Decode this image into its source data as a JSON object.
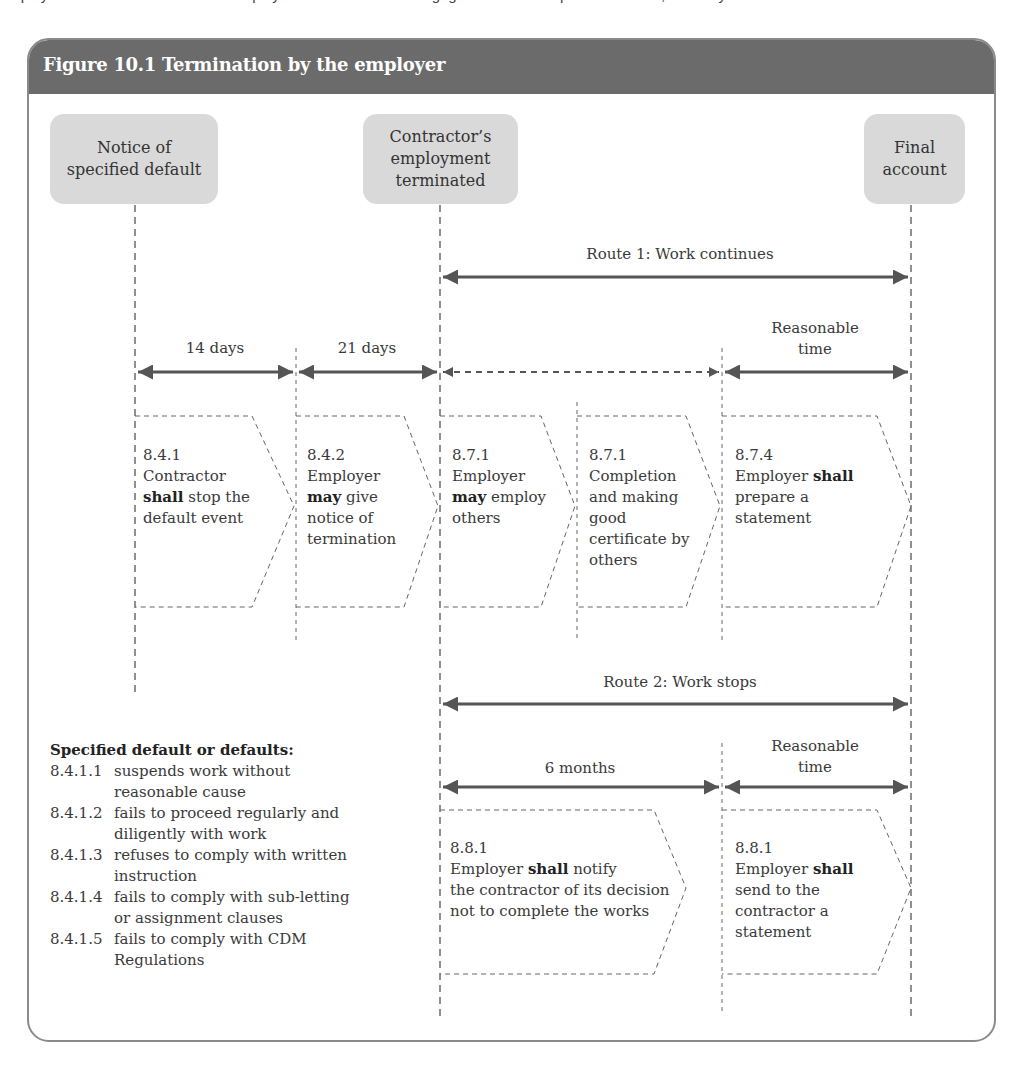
{
  "page_text_cutoff": "employment of the contractor. The employer is then entitled to engage others to complete the works, and only",
  "figure": {
    "title": "Figure 10.1  Termination by the employer",
    "colors": {
      "header": "#6b6b6b",
      "node": "#d9d9d9",
      "arrow": "#555555",
      "dash": "#555555"
    }
  },
  "nodes": [
    {
      "id": "notice",
      "label": "Notice of\nspecified default"
    },
    {
      "id": "terminated",
      "label": "Contractor’s\nemployment\nterminated"
    },
    {
      "id": "final",
      "label": "Final\naccount"
    }
  ],
  "routes": {
    "route1": {
      "label": "Route 1: Work continues"
    },
    "route2": {
      "label": "Route 2: Work stops"
    }
  },
  "periods": {
    "p14": "14 days",
    "p21": "21 days",
    "reasonable1": "Reasonable\ntime",
    "six_months": "6 months",
    "reasonable2": "Reasonable\ntime"
  },
  "steps": [
    {
      "clause": "8.4.1",
      "pre": "Contractor",
      "bold": "shall",
      "post": " stop the default event",
      "lines": [
        "Contractor",
        "shall stop the",
        "default event"
      ]
    },
    {
      "clause": "8.4.2",
      "pre": "Employer",
      "bold": "may",
      "post": " give notice of termination"
    },
    {
      "clause": "8.7.1",
      "pre": "Employer",
      "bold": "may",
      "post": " employ others"
    },
    {
      "clause": "8.7.1",
      "text": "Completion and making good certificate by others"
    },
    {
      "clause": "8.7.4",
      "pre": "Employer ",
      "bold": "shall",
      "post": "prepare a statement"
    },
    {
      "clause": "8.8.1",
      "pre": "Employer ",
      "bold": "shall",
      "post": " notify the contractor of its decision not to complete the works"
    },
    {
      "clause": "8.8.1",
      "pre": "Employer ",
      "bold": "shall",
      "post": "send to the contractor a statement"
    }
  ],
  "defaults": {
    "title": "Specified default or defaults:",
    "items": [
      {
        "code": "8.4.1.1",
        "text": "suspends work without reasonable cause"
      },
      {
        "code": "8.4.1.2",
        "text": "fails to proceed regularly and diligently with work"
      },
      {
        "code": "8.4.1.3",
        "text": "refuses to comply with written instruction"
      },
      {
        "code": "8.4.1.4",
        "text": "fails to comply with sub-letting or assignment clauses"
      },
      {
        "code": "8.4.1.5",
        "text": "fails to comply with CDM Regulations"
      }
    ]
  }
}
